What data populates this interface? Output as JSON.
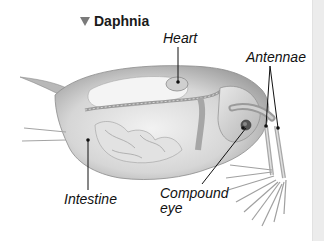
{
  "figure": {
    "title": "Daphnia",
    "title_marker": "triangle-down",
    "labels": {
      "heart": "Heart",
      "antennae": "Antennae",
      "intestine": "Intestine",
      "compound_eye_line1": "Compound",
      "compound_eye_line2": "eye"
    }
  },
  "colors": {
    "marker": "#7a7a7a",
    "label_text": "#111111",
    "body_light": "#e6e6e6",
    "body_mid": "#bdbdbd",
    "body_dark": "#8a8a8a",
    "edge_strip": "#ececec"
  }
}
